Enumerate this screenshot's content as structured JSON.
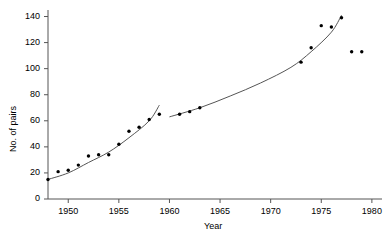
{
  "chart_data": {
    "type": "scatter",
    "title": "",
    "xlabel": "Year",
    "ylabel": "No. of pairs",
    "xlim": [
      1948,
      1981
    ],
    "ylim": [
      0,
      145
    ],
    "grid": false,
    "legend": "none",
    "x_ticks": [
      1950,
      1955,
      1960,
      1965,
      1970,
      1975,
      1980
    ],
    "y_ticks": [
      0,
      20,
      40,
      60,
      80,
      100,
      120,
      140
    ],
    "series": [
      {
        "name": "No. of pairs",
        "marker": "dot",
        "points": [
          {
            "x": 1948,
            "y": 15
          },
          {
            "x": 1949,
            "y": 21
          },
          {
            "x": 1950,
            "y": 22
          },
          {
            "x": 1951,
            "y": 26
          },
          {
            "x": 1952,
            "y": 33
          },
          {
            "x": 1953,
            "y": 34
          },
          {
            "x": 1954,
            "y": 34
          },
          {
            "x": 1955,
            "y": 42
          },
          {
            "x": 1956,
            "y": 52
          },
          {
            "x": 1957,
            "y": 55
          },
          {
            "x": 1958,
            "y": 61
          },
          {
            "x": 1959,
            "y": 65
          },
          {
            "x": 1961,
            "y": 65
          },
          {
            "x": 1962,
            "y": 67
          },
          {
            "x": 1963,
            "y": 70
          },
          {
            "x": 1973,
            "y": 105
          },
          {
            "x": 1974,
            "y": 116
          },
          {
            "x": 1975,
            "y": 133
          },
          {
            "x": 1976,
            "y": 132
          },
          {
            "x": 1977,
            "y": 139
          },
          {
            "x": 1978,
            "y": 113
          },
          {
            "x": 1979,
            "y": 113
          }
        ]
      },
      {
        "name": "fitted curve segment 1",
        "marker": "line",
        "points": [
          {
            "x": 1948,
            "y": 15
          },
          {
            "x": 1950,
            "y": 20
          },
          {
            "x": 1952,
            "y": 28
          },
          {
            "x": 1954,
            "y": 36
          },
          {
            "x": 1956,
            "y": 47
          },
          {
            "x": 1958,
            "y": 60
          },
          {
            "x": 1959,
            "y": 72
          }
        ]
      },
      {
        "name": "fitted curve segment 2",
        "marker": "line",
        "points": [
          {
            "x": 1960,
            "y": 63
          },
          {
            "x": 1963,
            "y": 70
          },
          {
            "x": 1966,
            "y": 79
          },
          {
            "x": 1969,
            "y": 89
          },
          {
            "x": 1972,
            "y": 101
          },
          {
            "x": 1974,
            "y": 113
          },
          {
            "x": 1976,
            "y": 128
          },
          {
            "x": 1977,
            "y": 141
          }
        ]
      }
    ]
  },
  "colors": {
    "axis": "#555555",
    "marker": "#000000",
    "curve": "#555555",
    "background": "#ffffff"
  }
}
